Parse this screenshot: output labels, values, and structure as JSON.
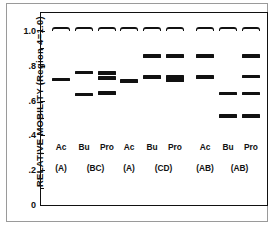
{
  "chart_data": {
    "type": "scatter",
    "title": "",
    "xlabel": "",
    "ylabel": "RELATIVE MOBILITY (Region 4=1.0)",
    "ylim": [
      0,
      1.08
    ],
    "yticks": [
      0,
      0.2,
      0.4,
      0.6,
      0.8,
      1.0
    ],
    "ytick_labels": [
      "0",
      ".2",
      ".4",
      ".6",
      ".8",
      "1.0"
    ],
    "yminor_ticks": [
      0.1,
      0.3,
      0.5,
      0.7,
      0.9
    ],
    "grid": false,
    "legend": "none",
    "note": "Electrophoretic band diagram: each lane shows horizontal bands at relative mobility values",
    "groups": [
      {
        "genotype_left": "(A)",
        "genotype_right": "(BC)",
        "lanes": [
          {
            "label": "Ac",
            "bands": [
              1.01,
              0.722
            ]
          },
          {
            "label": "Bu",
            "bands": [
              1.01,
              0.762,
              0.636
            ]
          },
          {
            "label": "Pro",
            "bands": [
              1.01,
              0.757,
              0.729,
              0.642
            ]
          }
        ]
      },
      {
        "genotype_left": "(A)",
        "genotype_right": "(CD)",
        "lanes": [
          {
            "label": "Ac",
            "bands": [
              1.01,
              0.712
            ]
          },
          {
            "label": "Bu",
            "bands": [
              1.01,
              0.856,
              0.735
            ]
          },
          {
            "label": "Pro",
            "bands": [
              1.01,
              0.856,
              0.735,
              0.719
            ]
          }
        ]
      },
      {
        "genotype_left": "(AB)",
        "genotype_right": "(AB)",
        "lanes": [
          {
            "label": "Ac",
            "bands": [
              1.01,
              0.856,
              0.735
            ]
          },
          {
            "label": "Bu",
            "bands": [
              1.01,
              0.641,
              0.512
            ]
          },
          {
            "label": "Pro",
            "bands": [
              1.01,
              0.857,
              0.738,
              0.641,
              0.513
            ]
          }
        ]
      }
    ]
  },
  "axis": {
    "ylabel": "RELATIVE MOBILITY (Region 4=1.0)",
    "ytick_labels": [
      "1.0",
      ".8",
      ".6",
      ".4",
      ".2",
      "0"
    ]
  },
  "colors": {
    "band": "#111111",
    "axis": "#111111",
    "frame": "#9a9a9a",
    "background": "#ffffff"
  }
}
